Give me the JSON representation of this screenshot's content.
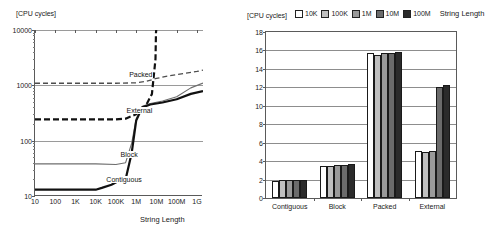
{
  "chart_data": [
    {
      "id": "left",
      "type": "line",
      "title": "",
      "ylabel": "[CPU cycles]",
      "xlabel": "String Length",
      "xscale": "log",
      "yscale": "log",
      "ylim": [
        10,
        10000
      ],
      "xlim": [
        10,
        2000000000
      ],
      "ytick_labels": [
        "10",
        "100",
        "1000",
        "10000"
      ],
      "ytick_values": [
        10,
        100,
        1000,
        10000
      ],
      "xtick_labels": [
        "10",
        "100",
        "1K",
        "10K",
        "100K",
        "1M",
        "10M",
        "100M",
        "1G"
      ],
      "xtick_values": [
        10,
        100,
        1000,
        10000,
        100000,
        1000000,
        10000000,
        100000000,
        1000000000
      ],
      "grid": "horizontal",
      "legend_position": "inline-labels",
      "series": [
        {
          "name": "Packed",
          "style": "dashed-thin",
          "color": "#4d4d4d",
          "label_x": 400000,
          "label_y": 1450,
          "points": [
            [
              10,
              1090
            ],
            [
              100,
              1090
            ],
            [
              1000,
              1090
            ],
            [
              10000,
              1090
            ],
            [
              100000,
              1090
            ],
            [
              1000000,
              1110
            ],
            [
              3000000,
              1180
            ],
            [
              10000000,
              1330
            ],
            [
              30000000,
              1450
            ],
            [
              100000000,
              1560
            ],
            [
              1000000000,
              1780
            ],
            [
              2000000000,
              1880
            ]
          ]
        },
        {
          "name": "External",
          "style": "dashed-thick",
          "color": "#111111",
          "label_x": 300000,
          "label_y": 330,
          "points": [
            [
              10,
              243
            ],
            [
              1000,
              243
            ],
            [
              100000,
              243
            ],
            [
              300000,
              250
            ],
            [
              1000000,
              300
            ],
            [
              3000000,
              430
            ],
            [
              6000000,
              700
            ],
            [
              9000000,
              3000
            ],
            [
              9500000,
              9000
            ],
            [
              9800000,
              10000
            ]
          ]
        },
        {
          "name": "Block",
          "style": "solid-thin",
          "color": "#6e6e6e",
          "label_x": 150000,
          "label_y": 52,
          "points": [
            [
              10,
              38
            ],
            [
              1000,
              38
            ],
            [
              10000,
              38
            ],
            [
              100000,
              37
            ],
            [
              300000,
              40
            ],
            [
              600000,
              90
            ],
            [
              1000000,
              250
            ],
            [
              2000000,
              420
            ],
            [
              5000000,
              470
            ],
            [
              20000000,
              520
            ],
            [
              100000000,
              620
            ],
            [
              500000000,
              900
            ],
            [
              2000000000,
              1100
            ]
          ]
        },
        {
          "name": "Contiguous",
          "style": "solid-thick",
          "color": "#111111",
          "label_x": 30000,
          "label_y": 19,
          "points": [
            [
              10,
              13
            ],
            [
              1000,
              13
            ],
            [
              10000,
              13
            ],
            [
              20000,
              14
            ],
            [
              60000,
              16
            ],
            [
              150000,
              19
            ],
            [
              300000,
              20
            ],
            [
              600000,
              60
            ],
            [
              1000000,
              230
            ],
            [
              2000000,
              400
            ],
            [
              5000000,
              450
            ],
            [
              20000000,
              490
            ],
            [
              100000000,
              560
            ],
            [
              500000000,
              700
            ],
            [
              2000000000,
              790
            ]
          ]
        }
      ]
    },
    {
      "id": "right",
      "type": "bar",
      "title": "",
      "ylabel": "[CPU cycles]",
      "legend_title": "String Length",
      "legend_position": "top",
      "categories": [
        "Contiguous",
        "Block",
        "Packed",
        "External"
      ],
      "ylim": [
        0,
        18
      ],
      "ytick_labels": [
        "0",
        "2",
        "4",
        "6",
        "8",
        "10",
        "12",
        "14",
        "16",
        "18"
      ],
      "ytick_values": [
        0,
        2,
        4,
        6,
        8,
        10,
        12,
        14,
        16,
        18
      ],
      "grid": "horizontal",
      "series": [
        {
          "name": "10K",
          "color": "#ffffff",
          "values": [
            1.85,
            3.5,
            15.7,
            5.1
          ]
        },
        {
          "name": "100K",
          "color": "#c0c0c0",
          "values": [
            1.9,
            3.5,
            15.55,
            4.95
          ]
        },
        {
          "name": "1M",
          "color": "#9a9a9a",
          "values": [
            1.95,
            3.55,
            15.7,
            5.15
          ]
        },
        {
          "name": "10M",
          "color": "#6b6b6b",
          "values": [
            1.95,
            3.6,
            15.75,
            12.0
          ]
        },
        {
          "name": "100M",
          "color": "#2b2b2b",
          "values": [
            1.98,
            3.68,
            15.8,
            12.3
          ]
        }
      ]
    }
  ]
}
